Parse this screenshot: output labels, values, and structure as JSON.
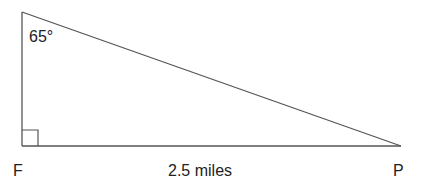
{
  "diagram": {
    "type": "right-triangle",
    "stroke_color": "#555555",
    "text_color": "#222222",
    "vertices": {
      "top": {
        "x": 22,
        "y": 12,
        "label": ""
      },
      "bottom_left": {
        "x": 22,
        "y": 146,
        "label": "F"
      },
      "bottom_right": {
        "x": 401,
        "y": 146,
        "label": "P"
      }
    },
    "angle_label": "65°",
    "right_angle_marker": {
      "x": 22,
      "y": 130,
      "size": 16
    },
    "labels": {
      "vertex_f": "F",
      "vertex_p": "P",
      "base_side": "2.5 miles",
      "top_angle": "65°"
    }
  }
}
